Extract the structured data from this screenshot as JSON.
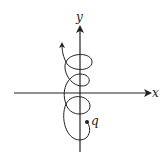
{
  "diagram": {
    "type": "charged-particle-trajectory",
    "axes": {
      "x_label": "x",
      "y_label": "y"
    },
    "particle": {
      "label": "q"
    },
    "trajectory": {
      "description": "looping cycloid path drifting upward along y-axis",
      "loop_count": 3
    },
    "colors": {
      "line": "#222222",
      "background": "#ffffff"
    }
  }
}
